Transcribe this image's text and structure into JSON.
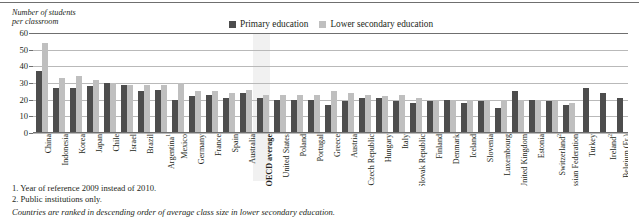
{
  "axis_title": "Number of students\nper classroom",
  "legend": [
    {
      "label": "Primary education",
      "color": "#4d4d4d",
      "key": "primary"
    },
    {
      "label": "Lower secondary education",
      "color": "#bfbfbf",
      "key": "lower_secondary"
    }
  ],
  "notes": {
    "note1": "1. Year of reference 2009 instead of 2010.",
    "note2": "2. Public institutions only.",
    "ranking": "Countries are ranked in descending order of average class size in lower secondary education."
  },
  "highlight": {
    "category": "OECD average",
    "color": "#eeeeee"
  },
  "chart_data": {
    "type": "bar",
    "title": "",
    "xlabel": "",
    "ylabel": "Number of students per classroom",
    "ylim": [
      0,
      60
    ],
    "yticks": [
      0,
      10,
      20,
      30,
      40,
      50,
      60
    ],
    "grid": true,
    "legend_position": "top-center",
    "categories": [
      "China",
      "Indonesia",
      "Korea",
      "Japan",
      "Chile",
      "Israel",
      "Brazil",
      "Argentina¹",
      "Mexico",
      "Germany",
      "France",
      "Spain",
      "Australia",
      "OECD average",
      "United States",
      "Poland",
      "Portugal",
      "Greece",
      "Austria",
      "Czech Republic",
      "Hungary",
      "Italy",
      "Slovak Republic",
      "Finland",
      "Denmark",
      "Iceland",
      "Slovenia",
      "Luxembourg",
      "United Kingdom",
      "Estonia",
      "Switzerland²",
      "Russian Federation",
      "Turkey",
      "Ireland²",
      "Belgium (Fr.)"
    ],
    "series": [
      {
        "name": "Primary education",
        "color": "#4d4d4d",
        "values": [
          37,
          27,
          27,
          28,
          30,
          29,
          25,
          26,
          20,
          22,
          23,
          21,
          24,
          21,
          20,
          20,
          20,
          17,
          19,
          21,
          21,
          19,
          18,
          19,
          20,
          18,
          19,
          15,
          25,
          20,
          19,
          17,
          27,
          24,
          21
        ]
      },
      {
        "name": "Lower secondary education",
        "color": "#bfbfbf",
        "values": [
          54,
          33,
          34,
          32,
          30,
          29,
          29,
          29,
          30,
          25,
          25,
          24,
          26,
          23,
          23,
          23,
          23,
          25,
          24,
          23,
          22,
          23,
          21,
          20,
          20,
          20,
          20,
          20,
          20,
          20,
          19,
          18,
          null,
          null,
          null
        ]
      }
    ]
  }
}
